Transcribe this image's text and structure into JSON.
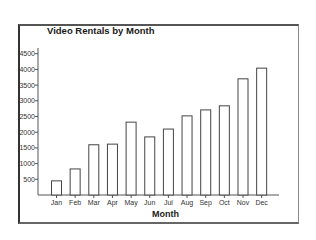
{
  "chart_data": {
    "type": "bar",
    "title": "Video Rentals by Month",
    "xlabel": "Month",
    "ylabel": "",
    "categories": [
      "Jan",
      "Feb",
      "Mar",
      "Apr",
      "May",
      "Jun",
      "Jul",
      "Aug",
      "Sep",
      "Oct",
      "Nov",
      "Dec"
    ],
    "values": [
      450,
      830,
      1600,
      1620,
      2320,
      1850,
      2100,
      2520,
      2710,
      2840,
      3700,
      4040
    ],
    "ylim": [
      0,
      4700
    ],
    "yticks": [
      500,
      1000,
      1500,
      2000,
      2500,
      3000,
      3500,
      4000,
      4500
    ],
    "grid": false,
    "legend": null,
    "bar_fill": "#ffffff",
    "bar_stroke": "#444444"
  }
}
